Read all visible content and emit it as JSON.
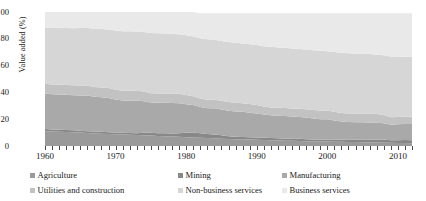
{
  "chart_data": {
    "type": "area",
    "stacked": true,
    "title": "",
    "xlabel": "",
    "ylabel": "Value added (%)",
    "ylim": [
      0,
      100
    ],
    "xlim": [
      1960,
      2012
    ],
    "yticks": [
      0,
      20,
      40,
      60,
      80,
      100
    ],
    "xticks": [
      1960,
      1970,
      1980,
      1990,
      2000,
      2010
    ],
    "xtick_labels": [
      "1960",
      "1970",
      "1980",
      "1990",
      "2000",
      "2010"
    ],
    "ytick_labels": [
      "0",
      "20",
      "40",
      "60",
      "80",
      "100"
    ],
    "grid": false,
    "minor_xticks_every": 1,
    "legend_position": "below",
    "legend_columns": 3,
    "x": [
      1960,
      1961,
      1962,
      1963,
      1964,
      1965,
      1966,
      1967,
      1968,
      1969,
      1970,
      1971,
      1972,
      1973,
      1974,
      1975,
      1976,
      1977,
      1978,
      1979,
      1980,
      1981,
      1982,
      1983,
      1984,
      1985,
      1986,
      1987,
      1988,
      1989,
      1990,
      1991,
      1992,
      1993,
      1994,
      1995,
      1996,
      1997,
      1998,
      1999,
      2000,
      2001,
      2002,
      2003,
      2004,
      2005,
      2006,
      2007,
      2008,
      2009,
      2010,
      2011,
      2012
    ],
    "series": [
      {
        "name": "Agriculture",
        "color": "#9a9a9a",
        "values": [
          11.0,
          10.8,
          10.6,
          10.4,
          10.2,
          10.0,
          9.7,
          9.4,
          9.2,
          9.0,
          8.8,
          8.6,
          8.4,
          8.2,
          8.0,
          7.8,
          7.5,
          7.3,
          7.1,
          6.9,
          6.6,
          6.4,
          6.2,
          5.9,
          5.7,
          5.5,
          5.3,
          5.1,
          5.0,
          4.8,
          4.6,
          4.5,
          4.3,
          4.2,
          4.0,
          3.9,
          3.8,
          3.6,
          3.5,
          3.4,
          3.3,
          3.2,
          3.1,
          3.0,
          2.9,
          2.8,
          2.7,
          2.6,
          2.5,
          2.4,
          2.3,
          2.2,
          2.1
        ]
      },
      {
        "name": "Mining",
        "color": "#888888",
        "values": [
          1.6,
          1.6,
          1.5,
          1.5,
          1.5,
          1.4,
          1.4,
          1.4,
          1.4,
          1.3,
          1.3,
          1.3,
          1.3,
          1.4,
          1.8,
          2.0,
          2.1,
          2.2,
          2.3,
          2.6,
          3.2,
          3.6,
          3.4,
          3.0,
          2.8,
          2.6,
          2.0,
          1.8,
          1.7,
          1.7,
          1.8,
          1.7,
          1.6,
          1.6,
          1.5,
          1.5,
          1.6,
          1.5,
          1.3,
          1.3,
          1.6,
          1.7,
          1.5,
          1.6,
          1.7,
          2.0,
          2.1,
          2.1,
          2.4,
          1.8,
          2.0,
          2.2,
          2.2
        ]
      },
      {
        "name": "Manufacturing",
        "color": "#a9a9a9",
        "values": [
          26.5,
          26.2,
          26.4,
          26.3,
          26.1,
          26.3,
          26.5,
          26.0,
          25.8,
          25.5,
          24.6,
          24.0,
          24.1,
          24.3,
          23.6,
          22.6,
          22.7,
          22.8,
          22.6,
          22.4,
          21.3,
          20.6,
          19.5,
          19.3,
          19.6,
          19.2,
          19.0,
          18.8,
          18.8,
          18.4,
          17.9,
          17.3,
          17.0,
          16.8,
          16.8,
          16.6,
          16.3,
          16.2,
          15.8,
          15.3,
          15.1,
          14.2,
          13.7,
          13.3,
          13.1,
          12.9,
          12.8,
          12.6,
          12.1,
          11.6,
          12.0,
          12.1,
          12.1
        ]
      },
      {
        "name": "Utilities and construction",
        "color": "#c2c2c2",
        "values": [
          7.4,
          7.3,
          7.4,
          7.4,
          7.5,
          7.5,
          7.4,
          7.3,
          7.3,
          7.4,
          7.3,
          7.3,
          7.4,
          7.4,
          7.2,
          7.0,
          6.9,
          6.9,
          7.0,
          7.1,
          6.9,
          6.6,
          6.4,
          6.3,
          6.4,
          6.5,
          6.5,
          6.5,
          6.4,
          6.4,
          6.3,
          6.0,
          5.9,
          5.9,
          6.0,
          6.0,
          6.1,
          6.2,
          6.3,
          6.4,
          6.5,
          6.5,
          6.4,
          6.4,
          6.5,
          6.6,
          6.7,
          6.5,
          6.2,
          5.7,
          5.4,
          5.3,
          5.4
        ]
      },
      {
        "name": "Non-business services",
        "color": "#d6d6d6",
        "values": [
          42.0,
          42.2,
          42.3,
          42.4,
          42.6,
          42.8,
          43.0,
          43.4,
          43.6,
          43.8,
          44.2,
          44.5,
          44.4,
          44.2,
          44.4,
          45.0,
          45.0,
          44.8,
          44.6,
          44.4,
          44.6,
          44.6,
          45.0,
          45.2,
          44.8,
          44.6,
          44.8,
          44.8,
          44.6,
          44.6,
          44.8,
          45.0,
          45.2,
          45.1,
          45.0,
          44.8,
          44.6,
          44.5,
          44.5,
          44.6,
          44.3,
          44.6,
          44.9,
          45.0,
          44.8,
          44.6,
          44.4,
          44.3,
          44.6,
          45.2,
          45.0,
          44.8,
          44.8
        ]
      },
      {
        "name": "Business services",
        "color": "#e9e9e9",
        "values": [
          11.5,
          11.9,
          11.8,
          12.0,
          12.1,
          12.0,
          12.0,
          12.5,
          12.7,
          13.0,
          13.8,
          14.3,
          14.4,
          14.5,
          15.0,
          15.6,
          15.8,
          16.0,
          16.4,
          16.6,
          17.4,
          18.2,
          18.5,
          19.3,
          19.7,
          20.6,
          21.4,
          22.0,
          22.5,
          23.1,
          23.6,
          24.5,
          25.0,
          25.4,
          25.7,
          26.2,
          26.6,
          27.0,
          27.6,
          28.0,
          28.2,
          28.8,
          29.4,
          29.7,
          30.0,
          30.1,
          30.3,
          31.0,
          31.2,
          32.3,
          32.3,
          32.4,
          32.4
        ]
      }
    ]
  },
  "axis": {
    "ylabel": "Value added (%)"
  },
  "legend": {
    "items": [
      {
        "label": "Agriculture",
        "color": "#9a9a9a"
      },
      {
        "label": "Mining",
        "color": "#888888"
      },
      {
        "label": "Manufacturing",
        "color": "#a9a9a9"
      },
      {
        "label": "Utilities and construction",
        "color": "#c2c2c2"
      },
      {
        "label": "Non-business services",
        "color": "#d6d6d6"
      },
      {
        "label": "Business services",
        "color": "#e9e9e9"
      }
    ]
  }
}
